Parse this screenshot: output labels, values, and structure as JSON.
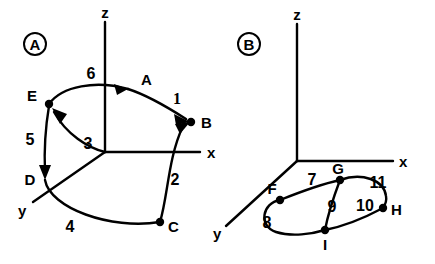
{
  "figure": {
    "background_color": "#ffffff",
    "stroke_color": "#000000",
    "panels": [
      {
        "id": "A",
        "marker_label": "A",
        "axes": [
          {
            "name": "z-axis",
            "label": "z"
          },
          {
            "name": "x-axis",
            "label": "x"
          },
          {
            "name": "y-axis",
            "label": "y"
          }
        ],
        "nodes": [
          {
            "id": "E",
            "label": "E"
          },
          {
            "id": "B",
            "label": "B"
          },
          {
            "id": "D",
            "label": "D"
          },
          {
            "id": "C",
            "label": "C"
          },
          {
            "id": "A",
            "label": "A"
          }
        ],
        "edges": [
          {
            "id": "1",
            "label": "1",
            "from": "A",
            "to": "B"
          },
          {
            "id": "2",
            "label": "2",
            "from": "C",
            "to": "B"
          },
          {
            "id": "3",
            "label": "3",
            "from": "origin",
            "to": "E"
          },
          {
            "id": "4",
            "label": "4",
            "from": "D",
            "to": "C"
          },
          {
            "id": "5",
            "label": "5",
            "from": "E",
            "to": "D"
          },
          {
            "id": "6",
            "label": "6",
            "from": "E",
            "to": "A"
          }
        ]
      },
      {
        "id": "B",
        "marker_label": "B",
        "axes": [
          {
            "name": "z-axis",
            "label": "z"
          },
          {
            "name": "x-axis",
            "label": "x"
          },
          {
            "name": "y-axis",
            "label": "y"
          }
        ],
        "nodes": [
          {
            "id": "F",
            "label": "F"
          },
          {
            "id": "G",
            "label": "G"
          },
          {
            "id": "H",
            "label": "H"
          },
          {
            "id": "I",
            "label": "I"
          }
        ],
        "edges": [
          {
            "id": "7",
            "label": "7",
            "from": "F",
            "to": "G"
          },
          {
            "id": "8",
            "label": "8",
            "from": "F",
            "to": "I"
          },
          {
            "id": "9",
            "label": "9",
            "from": "G",
            "to": "I"
          },
          {
            "id": "10",
            "label": "10",
            "from": "I",
            "to": "H"
          },
          {
            "id": "11",
            "label": "11",
            "from": "G",
            "to": "H"
          }
        ]
      }
    ]
  }
}
